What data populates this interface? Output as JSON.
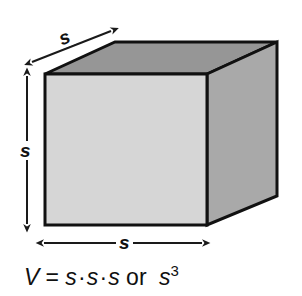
{
  "figure": {
    "background_color": "#ffffff",
    "shape": "cube"
  },
  "cube": {
    "front_face_color": "#d6d6d6",
    "top_face_color": "#969696",
    "right_face_color": "#a9a9a9",
    "edge_color": "#111111",
    "front_face_name": "front-face",
    "top_face_name": "top-face",
    "right_face_name": "right-face"
  },
  "dimensions": {
    "depth_label": "s",
    "height_label": "s",
    "width_label": "s",
    "arrow_color": "#1a1a1a"
  },
  "formula": {
    "variable": "V",
    "equals": "=",
    "factor1": "s",
    "dot1": "·",
    "factor2": "s",
    "dot2": "·",
    "factor3": "s",
    "conjunction": "or",
    "power_base": "s",
    "power_exponent": "3",
    "full_text": "V = s·s·s or s3"
  }
}
